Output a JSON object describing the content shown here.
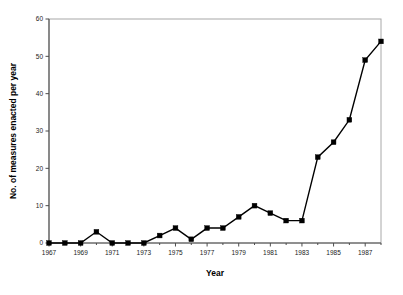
{
  "chart_data": {
    "type": "line",
    "title": "",
    "xlabel": "Year",
    "ylabel": "No. of measures enacted per year",
    "x": [
      1967,
      1968,
      1969,
      1970,
      1971,
      1972,
      1973,
      1974,
      1975,
      1976,
      1977,
      1978,
      1979,
      1980,
      1981,
      1982,
      1983,
      1984,
      1985,
      1986,
      1987,
      1988
    ],
    "values": [
      0,
      0,
      0,
      3,
      0,
      0,
      0,
      2,
      4,
      1,
      4,
      4,
      7,
      10,
      8,
      6,
      6,
      23,
      27,
      33,
      49,
      54
    ],
    "series": [
      {
        "name": "No. of measures enacted per year",
        "values": [
          0,
          0,
          0,
          3,
          0,
          0,
          0,
          2,
          4,
          1,
          4,
          4,
          7,
          10,
          8,
          6,
          6,
          23,
          27,
          33,
          49,
          54
        ]
      }
    ],
    "xlim": [
      1967,
      1988
    ],
    "ylim": [
      0,
      60
    ],
    "ytick_labels": [
      "0",
      "10",
      "20",
      "30",
      "40",
      "50",
      "60"
    ],
    "ytick_values": [
      0,
      10,
      20,
      30,
      40,
      50,
      60
    ],
    "xtick_labels": [
      "1967",
      "1969",
      "1971",
      "1973",
      "1975",
      "1977",
      "1979",
      "1981",
      "1983",
      "1985",
      "1987"
    ],
    "xtick_values": [
      1967,
      1969,
      1971,
      1973,
      1975,
      1977,
      1979,
      1981,
      1983,
      1985,
      1987
    ],
    "xtick_minor_values": [
      1968,
      1970,
      1972,
      1974,
      1976,
      1978,
      1980,
      1982,
      1984,
      1986,
      1988
    ],
    "grid": false,
    "legend": false,
    "marker": "square",
    "line_color": "#000000",
    "marker_color": "#000000",
    "frame_color": "#a8a8a8",
    "background": "#ffffff"
  }
}
